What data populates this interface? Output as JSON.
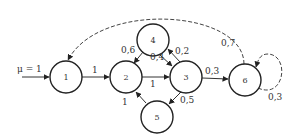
{
  "diagram": {
    "type": "state-transition-graph",
    "input_label": "μ = 1",
    "nodes": [
      {
        "id": "1",
        "label": "1"
      },
      {
        "id": "2",
        "label": "2"
      },
      {
        "id": "3",
        "label": "3"
      },
      {
        "id": "4",
        "label": "4"
      },
      {
        "id": "5",
        "label": "5"
      },
      {
        "id": "6",
        "label": "6"
      }
    ],
    "edges": [
      {
        "from": "1",
        "to": "2",
        "label": "1",
        "style": "solid"
      },
      {
        "from": "2",
        "to": "3",
        "label": "1",
        "style": "solid"
      },
      {
        "from": "4",
        "to": "2",
        "label": "0,6",
        "style": "solid"
      },
      {
        "from": "4",
        "to": "3",
        "label": "0,4",
        "style": "solid"
      },
      {
        "from": "3",
        "to": "4",
        "label": "0,2",
        "style": "solid"
      },
      {
        "from": "3",
        "to": "6",
        "label": "0,3",
        "style": "solid"
      },
      {
        "from": "3",
        "to": "5",
        "label": "0,5",
        "style": "solid"
      },
      {
        "from": "5",
        "to": "2",
        "label": "1",
        "style": "solid"
      },
      {
        "from": "6",
        "to": "1",
        "label": "0,7",
        "style": "dashed"
      },
      {
        "from": "6",
        "to": "6",
        "label": "0,3",
        "style": "dashed"
      }
    ]
  }
}
